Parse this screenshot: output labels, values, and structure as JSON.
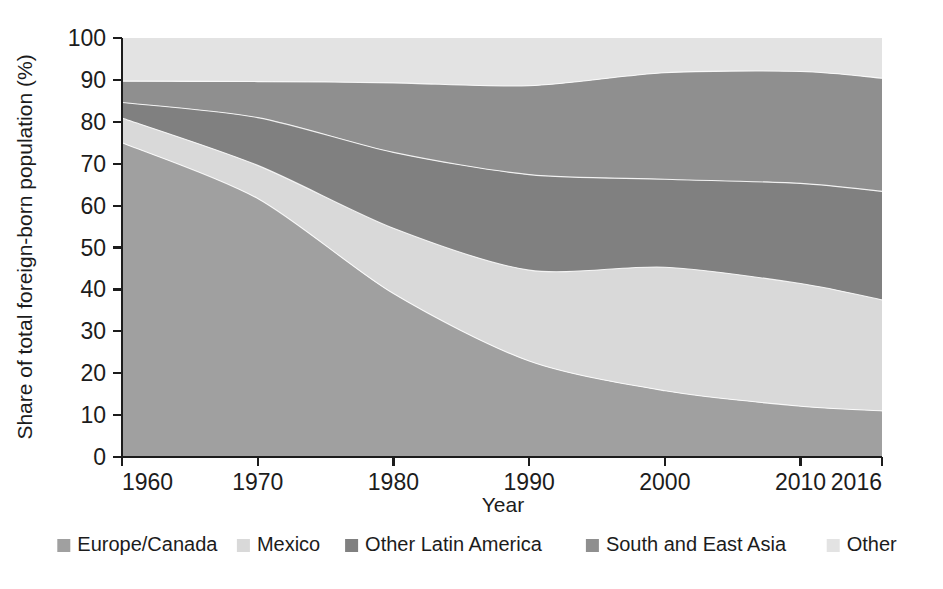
{
  "chart_data": {
    "type": "area",
    "title": "",
    "subtitle": "",
    "xlabel": "Year",
    "ylabel": "Share of total foreign-born population (%)",
    "xlim": [
      1960,
      2016
    ],
    "ylim": [
      0,
      100
    ],
    "grid": false,
    "stacked": true,
    "stack_order_bottom_to_top": [
      "Europe/Canada",
      "Mexico",
      "Other Latin America",
      "South and East Asia",
      "Other"
    ],
    "legend_position": "bottom",
    "x": [
      1960,
      1970,
      1980,
      1990,
      2000,
      2010,
      2016
    ],
    "xticks": [
      "1960",
      "1970",
      "1980",
      "1990",
      "2000",
      "2010",
      "2016"
    ],
    "yticks": [
      "0",
      "10",
      "20",
      "30",
      "40",
      "50",
      "60",
      "70",
      "80",
      "90",
      "100"
    ],
    "series": [
      {
        "name": "Europe/Canada",
        "color": "#a0a0a0",
        "values": [
          75.0,
          61.7,
          39.0,
          22.9,
          15.8,
          12.1,
          11.0
        ]
      },
      {
        "name": "Mexico",
        "color": "#d9d9d9",
        "values": [
          5.9,
          7.9,
          15.6,
          21.7,
          29.5,
          29.3,
          26.5
        ]
      },
      {
        "name": "Other Latin America",
        "color": "#808080",
        "values": [
          3.7,
          11.4,
          18.1,
          22.8,
          21.0,
          23.9,
          25.9
        ]
      },
      {
        "name": "South and East Asia",
        "color": "#8f8f8f",
        "values": [
          5.1,
          8.6,
          16.6,
          21.2,
          25.4,
          26.7,
          27.0
        ]
      },
      {
        "name": "Other",
        "color": "#e3e3e3",
        "values": [
          10.3,
          10.4,
          10.7,
          11.4,
          8.3,
          8.0,
          9.6
        ]
      }
    ],
    "cumulative_tops": {
      "Europe/Canada": [
        75.0,
        61.7,
        39.0,
        22.9,
        15.8,
        12.1,
        11.0
      ],
      "Mexico": [
        80.9,
        69.6,
        54.6,
        44.6,
        45.3,
        41.4,
        37.5
      ],
      "Other Latin America": [
        84.6,
        81.0,
        72.7,
        67.4,
        66.3,
        65.3,
        63.4
      ],
      "South and East Asia": [
        89.7,
        89.6,
        89.3,
        88.6,
        91.7,
        92.0,
        90.4
      ],
      "Other": [
        100,
        100,
        100,
        100,
        100,
        100,
        100
      ]
    }
  },
  "legend": {
    "items": [
      {
        "label": "Europe/Canada",
        "color": "#a0a0a0"
      },
      {
        "label": "Mexico",
        "color": "#d9d9d9"
      },
      {
        "label": "Other Latin America",
        "color": "#808080"
      },
      {
        "label": "South and East Asia",
        "color": "#8f8f8f"
      },
      {
        "label": "Other",
        "color": "#e3e3e3"
      }
    ]
  },
  "axes": {
    "x_title": "Year",
    "y_title": "Share of total foreign-born population (%)"
  }
}
